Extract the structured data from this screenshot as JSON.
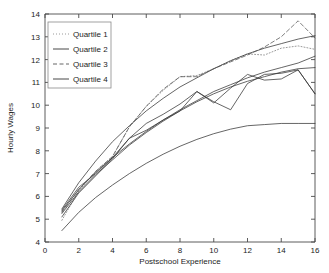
{
  "chart_data": {
    "type": "line",
    "title": "",
    "xlabel": "Postschool Experience",
    "ylabel": "Hourly Wages",
    "xlim": [
      0,
      16
    ],
    "ylim": [
      4,
      14
    ],
    "xticks": [
      0,
      2,
      4,
      6,
      8,
      10,
      12,
      14,
      16
    ],
    "yticks": [
      4,
      5,
      6,
      7,
      8,
      9,
      10,
      11,
      12,
      13,
      14
    ],
    "grid": false,
    "legend_position": "upper-left",
    "legend_entries": [
      {
        "label": "Quartile 1",
        "style": "dotted"
      },
      {
        "label": "Quartile 2",
        "style": "solid"
      },
      {
        "label": "Quartile 3",
        "style": "dashed"
      },
      {
        "label": "Quartile 4",
        "style": "solid"
      }
    ],
    "x": [
      1,
      2,
      3,
      4,
      5,
      6,
      7,
      8,
      9,
      10,
      11,
      12,
      13,
      14,
      15,
      16
    ],
    "series": [
      {
        "name": "Quartile 1 empirical",
        "style": "dotted",
        "values": [
          4.95,
          6.25,
          7.1,
          7.75,
          9.05,
          9.95,
          10.65,
          11.25,
          11.3,
          11.6,
          11.95,
          12.25,
          12.2,
          12.5,
          12.6,
          12.45
        ]
      },
      {
        "name": "Quartile 1 fitted",
        "style": "solid",
        "values": [
          5.45,
          6.6,
          7.55,
          8.4,
          9.1,
          9.75,
          10.3,
          10.8,
          11.2,
          11.6,
          11.95,
          12.25,
          12.5,
          12.7,
          12.9,
          13.05
        ]
      },
      {
        "name": "Quartile 2 empirical",
        "style": "solid",
        "values": [
          5.4,
          6.4,
          7.0,
          7.7,
          8.55,
          8.9,
          9.35,
          9.75,
          10.6,
          10.15,
          9.8,
          10.95,
          11.35,
          11.4,
          11.55,
          10.5
        ]
      },
      {
        "name": "Quartile 2 fitted",
        "style": "solid",
        "values": [
          5.35,
          6.3,
          7.05,
          7.7,
          8.3,
          8.85,
          9.35,
          9.8,
          10.2,
          10.6,
          10.9,
          11.2,
          11.45,
          11.65,
          11.85,
          12.15
        ]
      },
      {
        "name": "Quartile 3 empirical",
        "style": "dashed",
        "values": [
          5.3,
          6.3,
          7.1,
          7.75,
          9.05,
          9.95,
          10.7,
          11.25,
          11.25,
          11.6,
          11.9,
          12.2,
          12.55,
          13.0,
          13.7,
          12.95
        ]
      },
      {
        "name": "Quartile 3 fitted",
        "style": "solid",
        "values": [
          5.25,
          6.2,
          6.95,
          7.6,
          8.25,
          8.8,
          9.3,
          9.75,
          10.15,
          10.5,
          10.8,
          11.05,
          11.25,
          11.45,
          11.6,
          11.65
        ]
      },
      {
        "name": "Quartile 4 empirical",
        "style": "solid",
        "values": [
          5.1,
          6.15,
          6.9,
          7.65,
          8.55,
          9.2,
          9.6,
          10.05,
          10.6,
          10.1,
          10.75,
          11.35,
          11.1,
          11.15,
          11.55,
          10.5
        ]
      },
      {
        "name": "Quartile 4 fitted",
        "style": "solid",
        "values": [
          4.5,
          5.3,
          5.95,
          6.5,
          7.0,
          7.45,
          7.85,
          8.2,
          8.5,
          8.75,
          8.95,
          9.1,
          9.15,
          9.2,
          9.2,
          9.2
        ]
      }
    ]
  },
  "axes": {
    "xlabel": "Postschool Experience",
    "ylabel": "Hourly Wages",
    "xticklabels": [
      "0",
      "2",
      "4",
      "6",
      "8",
      "10",
      "12",
      "14",
      "16"
    ],
    "yticklabels": [
      "4",
      "5",
      "6",
      "7",
      "8",
      "9",
      "10",
      "11",
      "12",
      "13",
      "14"
    ]
  },
  "legend": {
    "items": [
      {
        "label": "Quartile 1"
      },
      {
        "label": "Quartile 2"
      },
      {
        "label": "Quartile 3"
      },
      {
        "label": "Quartile 4"
      }
    ]
  },
  "colors": {
    "axis": "#4a4a4a",
    "text": "#1c1c1c",
    "line_dark": "#333333",
    "line_mid": "#555555",
    "line_light": "#8f8f8f",
    "background": "#ffffff"
  }
}
